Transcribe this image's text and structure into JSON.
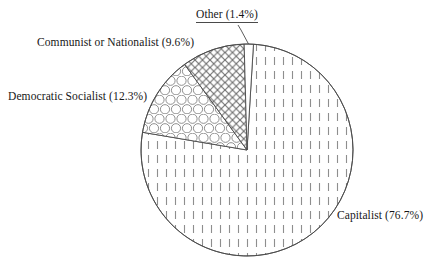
{
  "chart_data": {
    "type": "pie",
    "title": "",
    "categories": [
      "Capitalist",
      "Democratic Socialist",
      "Communist or Nationalist",
      "Other"
    ],
    "values": [
      76.7,
      9.6,
      12.3,
      1.4
    ],
    "value_unit": "%",
    "labels": [
      "Capitalist (76.7%)",
      "Democratic Socialist (12.3%)",
      "Communist or Nationalist (9.6%)",
      "Other (1.4%)"
    ],
    "slices": [
      {
        "name": "Capitalist",
        "label": "Capitalist (76.7%)",
        "value": 76.7,
        "fill_pattern": "vertical-dashed-lines",
        "start_angle_deg": 3.5,
        "end_angle_deg": 279.6
      },
      {
        "name": "Democratic Socialist",
        "label": "Democratic Socialist (12.3%)",
        "value": 12.3,
        "fill_pattern": "circles-hex-packing",
        "start_angle_deg": 279.6,
        "end_angle_deg": 323.9
      },
      {
        "name": "Communist or Nationalist",
        "label": "Communist or Nationalist (9.6%)",
        "value": 9.6,
        "fill_pattern": "diagonal-crosshatch",
        "start_angle_deg": 323.9,
        "end_angle_deg": 358.5
      },
      {
        "name": "Other",
        "label": "Other (1.4%)",
        "value": 1.4,
        "fill_pattern": "blank-white",
        "start_angle_deg": 358.5,
        "end_angle_deg": 363.5
      }
    ],
    "legend_position": "callout-labels",
    "grid": false,
    "xlabel": "",
    "ylabel": "",
    "colors": {
      "outline": "#4a4a4a",
      "pattern": "#8c8c8c",
      "background": "#ffffff",
      "text": "#161616"
    },
    "geometry": {
      "center_x": 247,
      "center_y": 150,
      "radius": 106,
      "start_angle_deg": 0,
      "direction": "clockwise"
    }
  }
}
